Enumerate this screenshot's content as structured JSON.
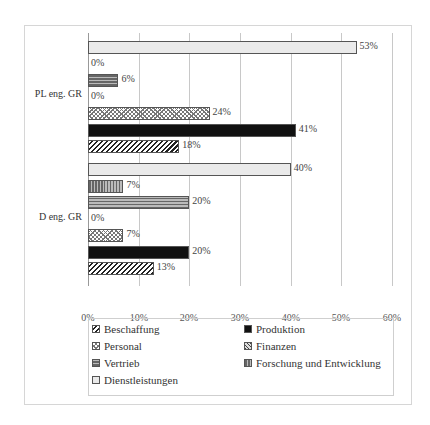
{
  "chart_data": {
    "type": "bar",
    "orientation": "horizontal",
    "title": "",
    "xlabel": "",
    "ylabel": "",
    "xlim": [
      0,
      60
    ],
    "x_ticks": [
      "0%",
      "10%",
      "20%",
      "30%",
      "40%",
      "50%",
      "60%"
    ],
    "grid": true,
    "legend_position": "bottom",
    "categories": [
      "PL eng. GR",
      "D eng. GR"
    ],
    "series": [
      {
        "name": "Dienstleistungen",
        "values": [
          53,
          40
        ],
        "labels": [
          "53%",
          "40%"
        ]
      },
      {
        "name": "Forschung und Entwicklung",
        "values": [
          0,
          7
        ],
        "labels": [
          "0%",
          "7%"
        ]
      },
      {
        "name": "Vertrieb",
        "values": [
          6,
          20
        ],
        "labels": [
          "6%",
          "20%"
        ]
      },
      {
        "name": "Finanzen",
        "values": [
          0,
          0
        ],
        "labels": [
          "0%",
          "0%"
        ]
      },
      {
        "name": "Personal",
        "values": [
          24,
          7
        ],
        "labels": [
          "24%",
          "7%"
        ]
      },
      {
        "name": "Produktion",
        "values": [
          41,
          20
        ],
        "labels": [
          "41%",
          "20%"
        ]
      },
      {
        "name": "Beschaffung",
        "values": [
          18,
          13
        ],
        "labels": [
          "18%",
          "13%"
        ]
      }
    ]
  },
  "legend": {
    "items": [
      {
        "label": "Beschaffung",
        "pattern": "diagonal-hatch"
      },
      {
        "label": "Produktion",
        "pattern": "solid-black"
      },
      {
        "label": "Personal",
        "pattern": "cross-hatch"
      },
      {
        "label": "Finanzen",
        "pattern": "fine-diagonal"
      },
      {
        "label": "Vertrieb",
        "pattern": "horizontal-stripes"
      },
      {
        "label": "Forschung und Entwicklung",
        "pattern": "vertical-stripes"
      },
      {
        "label": "Dienstleistungen",
        "pattern": "dotted-light"
      }
    ]
  }
}
